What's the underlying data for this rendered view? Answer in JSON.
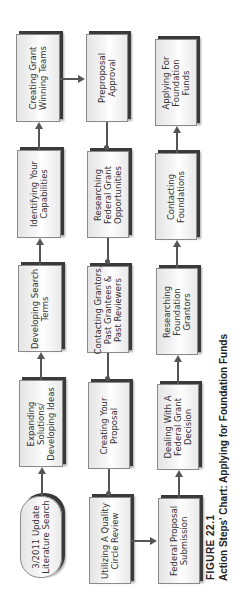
{
  "figure": {
    "number": "FIGURE 22.1",
    "title": "Action Steps' Chart: Applying for Foundation Funds"
  },
  "columns": [
    {
      "name": "column-1",
      "flow": "bottom-to-top",
      "nodes": [
        {
          "id": "literature-search",
          "label": "3/2011 Update\nLiterature Search",
          "shape": "rounded"
        },
        {
          "id": "expanding-solutions",
          "label": "Expanding\nSolutions/\nDeveloping Ideas",
          "shape": "rect"
        },
        {
          "id": "developing-search-terms",
          "label": "Developing Search\nTerms",
          "shape": "rect"
        },
        {
          "id": "identifying-capabilities",
          "label": "Identifying Your\nCapabilities",
          "shape": "rect"
        },
        {
          "id": "creating-grant-teams",
          "label": "Creating Grant\nWinning Teams",
          "shape": "rect"
        }
      ]
    },
    {
      "name": "column-2",
      "flow": "top-to-bottom",
      "nodes": [
        {
          "id": "preproposal-approval",
          "label": "Preproposal\nApproval",
          "shape": "rect"
        },
        {
          "id": "researching-federal",
          "label": "Researching\nFederal Grant\nOpportunities",
          "shape": "rect"
        },
        {
          "id": "contacting-grantors",
          "label": "Contacting Grantors,\nPast Grantees &\nPast Reviewers",
          "shape": "rect"
        },
        {
          "id": "creating-proposal",
          "label": "Creating Your\nProposal",
          "shape": "rect"
        },
        {
          "id": "quality-circle",
          "label": "Utilizing A Quality\nCircle Review",
          "shape": "rect"
        }
      ]
    },
    {
      "name": "column-3",
      "flow": "bottom-to-top",
      "nodes": [
        {
          "id": "federal-submission",
          "label": "Federal Proposal\nSubmission",
          "shape": "rect"
        },
        {
          "id": "federal-decision",
          "label": "Dealing With A\nFederal Grant\nDecision",
          "shape": "rect"
        },
        {
          "id": "researching-foundation",
          "label": "Researching\nFoundation\nGrantors",
          "shape": "rect"
        },
        {
          "id": "contacting-foundations",
          "label": "Contacting\nFoundations",
          "shape": "rect"
        },
        {
          "id": "applying-foundation",
          "label": "Applying For\nFoundation\nFunds",
          "shape": "rect"
        }
      ]
    }
  ],
  "connections": [
    {
      "from": "literature-search",
      "to": "expanding-solutions"
    },
    {
      "from": "expanding-solutions",
      "to": "developing-search-terms"
    },
    {
      "from": "developing-search-terms",
      "to": "identifying-capabilities"
    },
    {
      "from": "identifying-capabilities",
      "to": "creating-grant-teams"
    },
    {
      "from": "creating-grant-teams",
      "to": "preproposal-approval"
    },
    {
      "from": "preproposal-approval",
      "to": "researching-federal"
    },
    {
      "from": "researching-federal",
      "to": "contacting-grantors"
    },
    {
      "from": "contacting-grantors",
      "to": "creating-proposal"
    },
    {
      "from": "creating-proposal",
      "to": "quality-circle"
    },
    {
      "from": "quality-circle",
      "to": "federal-submission"
    },
    {
      "from": "federal-submission",
      "to": "federal-decision"
    },
    {
      "from": "federal-decision",
      "to": "researching-foundation"
    },
    {
      "from": "researching-foundation",
      "to": "contacting-foundations"
    },
    {
      "from": "contacting-foundations",
      "to": "applying-foundation"
    }
  ]
}
